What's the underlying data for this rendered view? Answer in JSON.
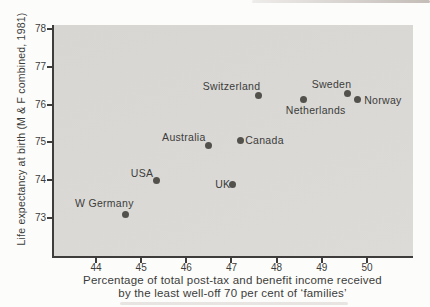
{
  "figure": {
    "ylabel": "Life expectancy at birth (M & F combined, 1981)",
    "xlabel_line1": "Percentage of total post-tax and benefit income received",
    "xlabel_line2": "by the least well-off 70 per cent of ‘families’"
  },
  "colors": {
    "page_bg": "#fcfcfb",
    "plot_bg": "#d7d6d3",
    "plot_bg_light": "#dcdbd8",
    "axis": "#3e3d3b",
    "dot": "#53514c",
    "text": "#3c3c3a",
    "smudge": "#9e928a"
  },
  "chart_data": {
    "type": "scatter",
    "title": "",
    "xlabel": "Percentage of total post-tax and benefit income received by the least well-off 70 per cent of ‘families’",
    "ylabel": "Life expectancy at birth (M & F combined, 1981)",
    "xlim": [
      43.07,
      51.02
    ],
    "ylim": [
      72.0,
      78.1
    ],
    "xticks": [
      44,
      45,
      46,
      47,
      48,
      49,
      50
    ],
    "yticks": [
      73,
      74,
      75,
      76,
      77,
      78
    ],
    "grid": false,
    "legend": false,
    "points": [
      {
        "label": "W Germany",
        "x": 44.65,
        "y": 73.1,
        "label_offset": [
          -21,
          -11
        ]
      },
      {
        "label": "USA",
        "x": 45.33,
        "y": 74.0,
        "label_offset": [
          -14,
          -7.5
        ]
      },
      {
        "label": "Australia",
        "x": 46.5,
        "y": 74.92,
        "label_offset": [
          -25,
          -8.5
        ]
      },
      {
        "label": "UK",
        "x": 47.03,
        "y": 73.9,
        "label_offset": [
          -10,
          0
        ]
      },
      {
        "label": "Canada",
        "x": 47.2,
        "y": 75.05,
        "label_offset": [
          24,
          -0.5
        ]
      },
      {
        "label": "Switzerland",
        "x": 47.6,
        "y": 76.23,
        "label_offset": [
          -27,
          -10
        ]
      },
      {
        "label": "Netherlands",
        "x": 48.6,
        "y": 76.13,
        "label_offset": [
          12,
          10
        ]
      },
      {
        "label": "Sweden",
        "x": 49.57,
        "y": 76.28,
        "label_offset": [
          -16,
          -9.5
        ]
      },
      {
        "label": "Norway",
        "x": 49.8,
        "y": 76.13,
        "label_offset": [
          25,
          0
        ]
      }
    ]
  }
}
